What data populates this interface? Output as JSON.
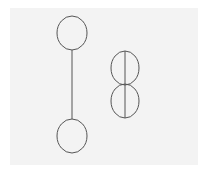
{
  "diagram": {
    "background": "#f3f3f3",
    "stroke": "#555555",
    "figures": [
      {
        "name": "dumbbell-figure",
        "top_ellipse": {
          "cx": 72,
          "cy": 33,
          "rx": 15,
          "ry": 17
        },
        "bottom_ellipse": {
          "cx": 72,
          "cy": 136,
          "rx": 15,
          "ry": 17
        },
        "connector": {
          "x1": 72,
          "y1": 50,
          "x2": 72,
          "y2": 119
        }
      },
      {
        "name": "stacked-ellipses-figure",
        "upper_ellipse": {
          "cx": 125,
          "cy": 68,
          "rx": 14,
          "ry": 17
        },
        "lower_ellipse": {
          "cx": 125,
          "cy": 101,
          "rx": 14,
          "ry": 17
        },
        "axis_line": {
          "x1": 125,
          "y1": 51,
          "x2": 125,
          "y2": 118
        }
      }
    ]
  }
}
